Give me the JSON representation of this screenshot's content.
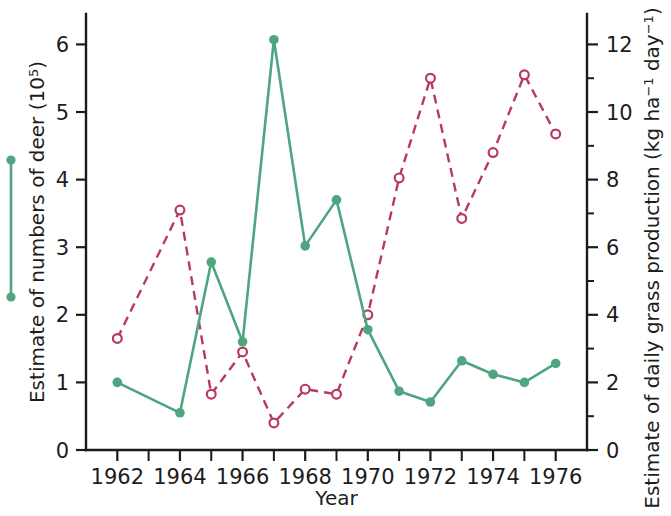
{
  "chart_data": {
    "type": "line",
    "title": "",
    "xlabel": "Year",
    "ylabel_left": "Estimate of numbers of deer (10⁵)",
    "ylabel_right": "Estimate of daily grass production (kg ha⁻¹ day⁻¹)",
    "x": [
      1962,
      1963,
      1964,
      1965,
      1966,
      1967,
      1968,
      1969,
      1970,
      1971,
      1972,
      1973,
      1974,
      1975,
      1976
    ],
    "xlim": [
      1961,
      1977
    ],
    "xtick_labels": [
      "1962",
      "1964",
      "1966",
      "1968",
      "1970",
      "1972",
      "1974",
      "1976"
    ],
    "xtick_values": [
      1962,
      1964,
      1966,
      1968,
      1970,
      1972,
      1974,
      1976
    ],
    "xtick_minor_values": [
      1963,
      1965,
      1967,
      1969,
      1971,
      1973,
      1975
    ],
    "ylim_left": [
      0,
      6.45
    ],
    "ytick_left_labels": [
      "0",
      "1",
      "2",
      "3",
      "4",
      "5",
      "6"
    ],
    "ytick_left_values": [
      0,
      1,
      2,
      3,
      4,
      5,
      6
    ],
    "ylim_right": [
      0,
      12.9
    ],
    "ytick_right_labels": [
      "0",
      "2",
      "4",
      "6",
      "8",
      "10",
      "12"
    ],
    "ytick_right_values": [
      0,
      2,
      4,
      6,
      8,
      10,
      12
    ],
    "ytick_right_minor_values": [
      1,
      3,
      5,
      7,
      9,
      11
    ],
    "grid": false,
    "legend_position": "left-outside",
    "series": [
      {
        "name": "Estimate of numbers of deer (10⁵)",
        "axis": "left",
        "style": "solid",
        "marker": "filled-circle",
        "color": "#4fa57f",
        "x": [
          1962,
          1964,
          1965,
          1966,
          1967,
          1968,
          1969,
          1970,
          1971,
          1972,
          1973,
          1974,
          1975,
          1976
        ],
        "values": [
          1.0,
          0.55,
          2.78,
          1.6,
          6.07,
          3.02,
          3.7,
          1.78,
          0.87,
          0.71,
          1.32,
          1.12,
          1.0,
          1.28
        ]
      },
      {
        "name": "Estimate of daily grass production (kg ha⁻¹ day⁻¹)",
        "axis": "right",
        "style": "dashed",
        "marker": "open-circle",
        "color": "#b83a5c",
        "x": [
          1962,
          1964,
          1965,
          1966,
          1967,
          1968,
          1969,
          1970,
          1971,
          1972,
          1973,
          1974,
          1975,
          1976
        ],
        "values": [
          3.3,
          7.1,
          1.65,
          2.9,
          0.8,
          1.8,
          1.65,
          4.0,
          8.05,
          11.0,
          6.85,
          8.8,
          11.1,
          9.35
        ]
      }
    ],
    "legend_marker": {
      "type": "vertical-bar-with-dots",
      "color": "#4fa57f"
    }
  }
}
